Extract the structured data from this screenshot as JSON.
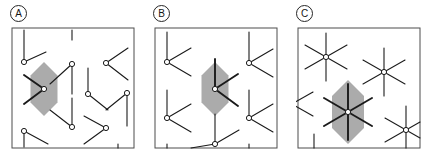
{
  "figure": {
    "background_color": "#ffffff",
    "panel_count": 3
  },
  "style": {
    "frame_color": "#4d4d4d",
    "frame_width": 1,
    "bond_color": "#1a1a1a",
    "bond_width": 1.1,
    "thick_bond_width": 1.9,
    "hexagon_fill": "#ababab",
    "hexagon_stroke": "none",
    "node_fill": "#ffffff",
    "node_stroke": "#1a1a1a",
    "node_radius": 2.6,
    "label_text_color": "#161616",
    "label_ring_color": "#262626"
  },
  "panels": [
    {
      "id": "panel-a",
      "label": "A",
      "label_name": "panel-label-a",
      "coordination": 2,
      "vertex_type": "two-arm-v-vertex",
      "description": "Sparse honeycomb with two-armed V vertices terminated by open circles; one hexagon cell highlighted in gray.",
      "frame": {
        "x": 2,
        "y": 2,
        "width": 122,
        "height": 120
      },
      "highlight_hexagon": {
        "cx": 34,
        "cy": 63,
        "r": 27,
        "orientation": "flat-left-right"
      },
      "vertices": [
        {
          "cx": 14,
          "cy": 36,
          "arms_deg": [
            90,
            325
          ]
        },
        {
          "cx": 62,
          "cy": 38,
          "arms_deg": [
            215,
            90
          ]
        },
        {
          "cx": 96,
          "cy": 37,
          "arms_deg": [
            325,
            35
          ]
        },
        {
          "cx": 34,
          "cy": 63,
          "arms_deg": [
            125,
            235
          ],
          "emphasis": "thick"
        },
        {
          "cx": 78,
          "cy": 68,
          "arms_deg": [
            90,
            330
          ]
        },
        {
          "cx": 117,
          "cy": 67,
          "arms_deg": [
            215,
            90
          ]
        },
        {
          "cx": 62,
          "cy": 101,
          "arms_deg": [
            125,
            90
          ]
        },
        {
          "cx": 14,
          "cy": 105,
          "arms_deg": [
            90,
            325
          ]
        },
        {
          "cx": 96,
          "cy": 102,
          "arms_deg": [
            145,
            215
          ]
        }
      ]
    },
    {
      "id": "panel-b",
      "label": "B",
      "label_name": "panel-label-b",
      "coordination": 3,
      "vertex_type": "three-arm-y-vertex",
      "description": "Honeycomb with three-armed Y vertices; central hexagon cell highlighted in gray with a thick three-arm vertex at its center.",
      "frame": {
        "x": 2,
        "y": 2,
        "width": 122,
        "height": 120
      },
      "highlight_hexagon": {
        "cx": 62,
        "cy": 63,
        "r": 27,
        "orientation": "flat-left-right"
      },
      "vertices": [
        {
          "cx": 14,
          "cy": 36,
          "arms_deg": [
            90,
            325,
            215
          ]
        },
        {
          "cx": 96,
          "cy": 37,
          "arms_deg": [
            90,
            325,
            215
          ]
        },
        {
          "cx": 62,
          "cy": 63,
          "arms_deg": [
            90,
            330,
            300
          ],
          "emphasis": "thick"
        },
        {
          "cx": 14,
          "cy": 92,
          "arms_deg": [
            90,
            325,
            215
          ]
        },
        {
          "cx": 96,
          "cy": 92,
          "arms_deg": [
            90,
            325,
            215
          ]
        },
        {
          "cx": 62,
          "cy": 118,
          "arms_deg": [
            90,
            325,
            215
          ]
        }
      ]
    },
    {
      "id": "panel-c",
      "label": "C",
      "label_name": "panel-label-c",
      "coordination": 6,
      "vertex_type": "six-arm-star-vertex",
      "description": "Lattice of six-armed star vertices; one hexagon cell highlighted in gray with a thick six-arm star at its center.",
      "frame": {
        "x": 2,
        "y": 2,
        "width": 122,
        "height": 120
      },
      "highlight_hexagon": {
        "cx": 52,
        "cy": 86,
        "r": 32,
        "orientation": "flat-left-right"
      },
      "vertices": [
        {
          "cx": 30,
          "cy": 31,
          "arms_deg": [
            90,
            270,
            30,
            210,
            330,
            150
          ]
        },
        {
          "cx": 88,
          "cy": 46,
          "arms_deg": [
            90,
            270,
            30,
            210,
            330,
            150
          ]
        },
        {
          "cx": 52,
          "cy": 86,
          "arms_deg": [
            90,
            270,
            30,
            210,
            330,
            150
          ],
          "emphasis": "thick"
        },
        {
          "cx": 110,
          "cy": 104,
          "arms_deg": [
            90,
            270,
            30,
            210,
            330,
            150
          ]
        },
        {
          "cx": -4,
          "cy": 78,
          "arms_deg": [
            90,
            270,
            30,
            210,
            330,
            150
          ]
        }
      ]
    }
  ]
}
